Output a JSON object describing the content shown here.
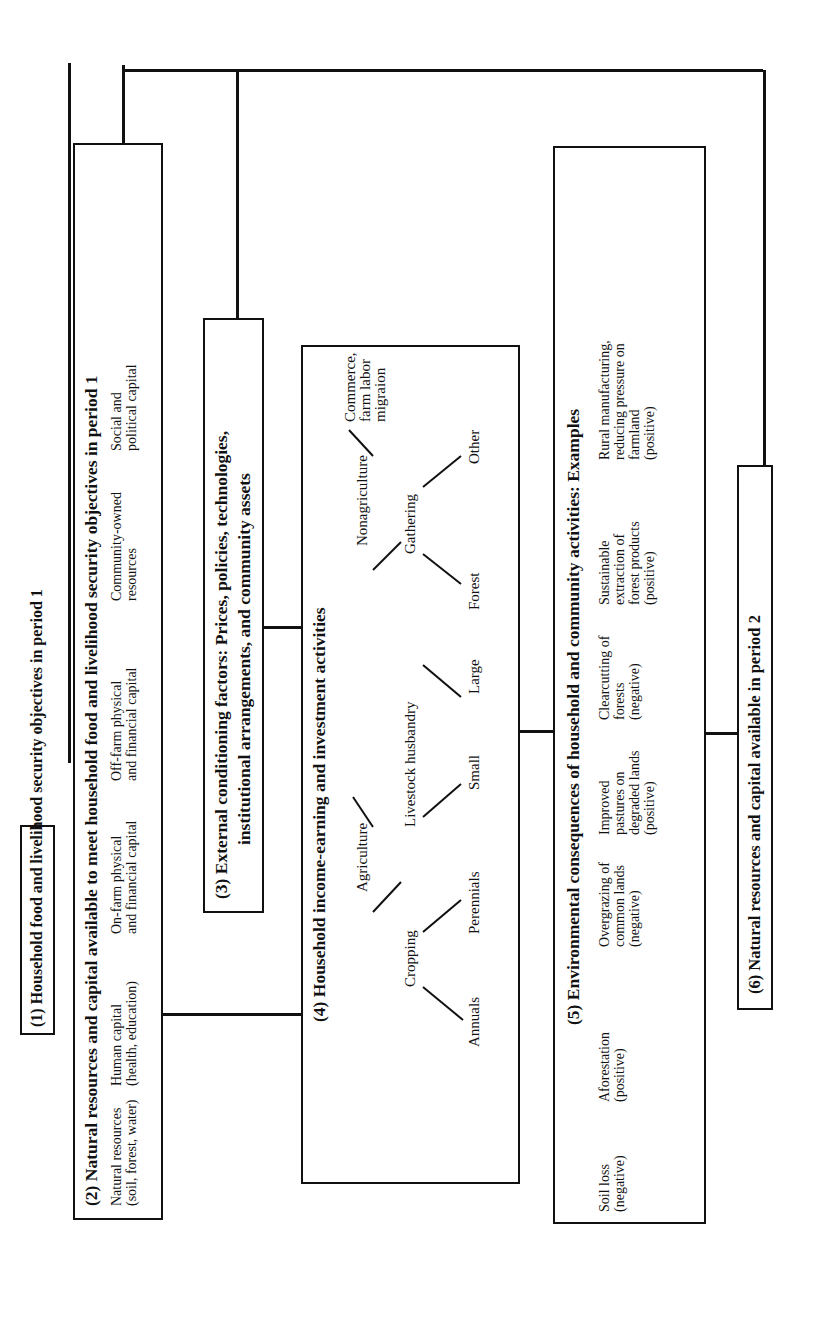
{
  "box1": {
    "title": "(1) Household food and livelihood security objectives in period 1"
  },
  "box2": {
    "title": "(2) Natural resources and capital available to meet household food and livelihood security objectives in period 1",
    "items": [
      "Natural resources\n(soil, forest, water)",
      "Human capital\n(health, education)",
      "On-farm physical\nand financial capital",
      "Off-farm physical\nand financial capital",
      "Community-owned\nresources",
      "Social and\npolitical capital"
    ]
  },
  "box3": {
    "title_line1": "(3) External conditioning factors:  Prices, policies, technologies,",
    "title_line2": "institutional  arrangements, and community assets"
  },
  "box4": {
    "title": "(4) Household income-earning and investment activities",
    "tree": {
      "agriculture": "Agriculture",
      "cropping": "Cropping",
      "annuals": "Annuals",
      "perennials": "Perennials",
      "livestock": "Livestock husbandry",
      "small": "Small",
      "large": "Large",
      "nonagriculture": "Nonagriculture",
      "gathering": "Gathering",
      "forest": "Forest",
      "other": "Other",
      "commerce": "Commerce,\nfarm labor\nmigraion"
    }
  },
  "box5": {
    "title": "(5) Environmental consequences of household and community activities: Examples",
    "items": [
      "Soil loss\n(negative)",
      "Aforestation\n(positive)",
      "Overgrazing of\ncommon lands\n(negative)",
      "Improved\npastures on\ndegraded lands\n(positive)",
      "Clearcutting of\nforests\n(negative)",
      "Sustainable\nextraction of\nforest products\n(positive)",
      "Rural manufacturing,\nreducing pressure on\nfarmland\n(positive)"
    ]
  },
  "box6": {
    "title": "(6) Natural resources and capital available in period 2"
  }
}
